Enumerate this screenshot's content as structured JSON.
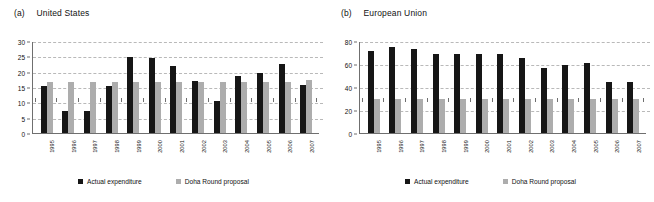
{
  "figure": {
    "legend": {
      "actual_label": "Actual expenditure",
      "doha_label": "Doha Round proposal",
      "actual_color": "#161616",
      "doha_color": "#adadad"
    }
  },
  "panels": [
    {
      "tag": "(a)",
      "name": "United States"
    },
    {
      "tag": "(b)",
      "name": "European Union"
    }
  ],
  "chart_data": [
    {
      "type": "bar",
      "title": "(a) United States",
      "xlabel": "",
      "ylabel": "",
      "ylim": [
        0,
        30
      ],
      "yticks": [
        0,
        5,
        10,
        15,
        20,
        25,
        30
      ],
      "grid": true,
      "legend_position": "bottom",
      "categories": [
        "1995",
        "1996",
        "1997",
        "1998",
        "1999",
        "2000",
        "2001",
        "2002",
        "2003",
        "2004",
        "2005",
        "2006",
        "2007"
      ],
      "series": [
        {
          "name": "Actual expenditure",
          "color": "#161616",
          "values": [
            15.2,
            7.3,
            7.3,
            15.4,
            24.8,
            24.5,
            22.0,
            16.8,
            10.4,
            18.5,
            19.6,
            22.5,
            15.8
          ]
        },
        {
          "name": "Doha Round proposal",
          "color": "#adadad",
          "values": [
            16.7,
            16.7,
            16.7,
            16.7,
            16.7,
            16.7,
            16.7,
            16.7,
            16.7,
            16.7,
            16.7,
            16.7,
            17.3
          ]
        }
      ]
    },
    {
      "type": "bar",
      "title": "(b) European Union",
      "xlabel": "",
      "ylabel": "",
      "ylim": [
        0,
        80
      ],
      "yticks": [
        0,
        20,
        40,
        60,
        80
      ],
      "grid": true,
      "legend_position": "bottom",
      "categories": [
        "1995",
        "1996",
        "1997",
        "1998",
        "1999",
        "2000",
        "2001",
        "2002",
        "2003",
        "2004",
        "2005",
        "2006",
        "2007"
      ],
      "series": [
        {
          "name": "Actual expenditure",
          "color": "#161616",
          "values": [
            71.0,
            75.0,
            73.0,
            69.0,
            69.0,
            68.5,
            68.5,
            65.0,
            56.5,
            59.5,
            61.0,
            44.0,
            44.0
          ]
        },
        {
          "name": "Doha Round proposal",
          "color": "#adadad",
          "values": [
            29.5,
            29.5,
            29.5,
            29.5,
            29.5,
            29.5,
            29.5,
            29.5,
            29.5,
            29.5,
            29.5,
            30.0,
            30.0
          ]
        }
      ]
    }
  ]
}
